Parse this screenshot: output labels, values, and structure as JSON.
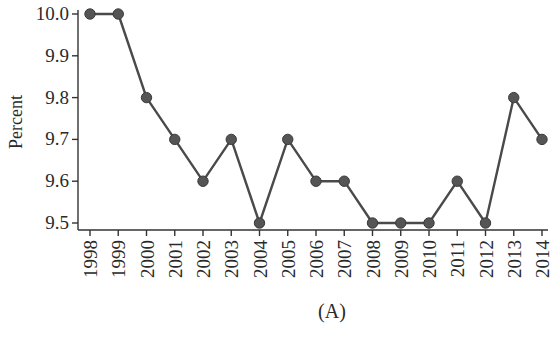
{
  "chart_data": {
    "type": "line",
    "title": "",
    "caption": "(A)",
    "xlabel": "",
    "ylabel": "Percent",
    "categories": [
      "1998",
      "1999",
      "2000",
      "2001",
      "2002",
      "2003",
      "2004",
      "2005",
      "2006",
      "2007",
      "2008",
      "2009",
      "2010",
      "2011",
      "2012",
      "2013",
      "2014"
    ],
    "series": [
      {
        "name": "Percent",
        "values": [
          10.0,
          10.0,
          9.8,
          9.7,
          9.6,
          9.7,
          9.5,
          9.7,
          9.6,
          9.6,
          9.5,
          9.5,
          9.5,
          9.6,
          9.5,
          9.8,
          9.7
        ]
      }
    ],
    "ylim": [
      9.5,
      10.0
    ],
    "yticks": [
      "9.5",
      "9.6",
      "9.7",
      "9.8",
      "9.9",
      "10.0"
    ],
    "grid": false,
    "legend": null,
    "markers": "filled-circle",
    "colors": {
      "line": "#4a4a4a",
      "marker": "#555555",
      "text": "#2a2a2a"
    }
  }
}
